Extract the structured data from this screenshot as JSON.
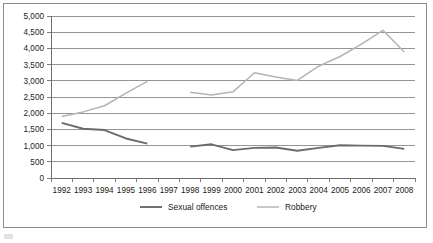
{
  "chart_data": {
    "type": "line",
    "title": "",
    "xlabel": "",
    "ylabel": "",
    "x": [
      1992,
      1993,
      1994,
      1995,
      1996,
      1997,
      1998,
      1999,
      2000,
      2001,
      2002,
      2003,
      2004,
      2005,
      2006,
      2007,
      2008
    ],
    "categories": [
      "1992",
      "1993",
      "1994",
      "1995",
      "1996",
      "1997",
      "1998",
      "1999",
      "2000",
      "2001",
      "2002",
      "2003",
      "2004",
      "2005",
      "2006",
      "2007",
      "2008"
    ],
    "ylim": [
      0,
      5000
    ],
    "ytick_step": 500,
    "yticks": [
      0,
      500,
      1000,
      1500,
      2000,
      2500,
      3000,
      3500,
      4000,
      4500,
      5000
    ],
    "ytick_labels": [
      "0",
      "500",
      "1,000",
      "1,500",
      "2,000",
      "2,500",
      "3,000",
      "3,500",
      "4,000",
      "4,500",
      "5,000"
    ],
    "grid": true,
    "legend_position": "bottom",
    "series": [
      {
        "name": "Sexual offences",
        "color": "#6b6b6b",
        "stroke_width": 1.9,
        "values": [
          1700,
          1520,
          1480,
          1220,
          1060,
          null,
          970,
          1040,
          860,
          930,
          940,
          840,
          930,
          1010,
          1000,
          990,
          900
        ]
      },
      {
        "name": "Robbery",
        "color": "#b4b4b4",
        "stroke_width": 1.5,
        "values": [
          1900,
          2040,
          2230,
          2620,
          2980,
          null,
          2650,
          2560,
          2660,
          3250,
          3120,
          3010,
          3450,
          3750,
          4130,
          4560,
          3890
        ]
      }
    ]
  },
  "legend": {
    "items": [
      {
        "label": "Sexual offences",
        "color": "#6b6b6b"
      },
      {
        "label": "Robbery",
        "color": "#b4b4b4"
      }
    ]
  },
  "axes": {
    "x_tick_labels": [
      "1992",
      "1993",
      "1994",
      "1995",
      "1996",
      "1997",
      "1998",
      "1999",
      "2000",
      "2001",
      "2002",
      "2003",
      "2004",
      "2005",
      "2006",
      "2007",
      "2008"
    ],
    "y_tick_labels": [
      "5,000",
      "4,500",
      "4,000",
      "3,500",
      "3,000",
      "2,500",
      "2,000",
      "1,500",
      "1,000",
      "500",
      "0"
    ]
  },
  "colors": {
    "sexual_offences": "#6b6b6b",
    "robbery": "#b4b4b4",
    "gridline": "#8a8a8a",
    "border": "#8e8e8e",
    "text": "#1a1a1a"
  }
}
